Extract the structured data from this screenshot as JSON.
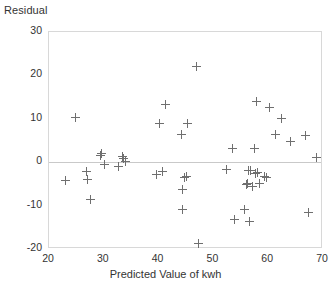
{
  "chart_data": {
    "type": "scatter",
    "title": "",
    "xlabel": "Predicted Value of kwh",
    "ylabel": "Residual",
    "xlim": [
      20,
      70
    ],
    "ylim": [
      -20,
      30
    ],
    "xticks": [
      20,
      30,
      40,
      50,
      60,
      70
    ],
    "yticks": [
      30,
      20,
      10,
      0,
      -10,
      -20
    ],
    "grid": false,
    "legend": null,
    "reference_lines": [
      {
        "axis": "y",
        "value": 0
      }
    ],
    "marker": "plus",
    "marker_color": "#6f6f6f",
    "points": [
      {
        "x": 23.0,
        "y": -4.3
      },
      {
        "x": 24.8,
        "y": 10.2
      },
      {
        "x": 26.9,
        "y": -2.1
      },
      {
        "x": 27.1,
        "y": -4.1
      },
      {
        "x": 27.5,
        "y": -8.7
      },
      {
        "x": 29.4,
        "y": 1.6
      },
      {
        "x": 29.6,
        "y": 1.9
      },
      {
        "x": 30.2,
        "y": -0.6
      },
      {
        "x": 32.6,
        "y": -0.9
      },
      {
        "x": 33.4,
        "y": 1.3
      },
      {
        "x": 33.6,
        "y": 0.8
      },
      {
        "x": 33.9,
        "y": 0.1
      },
      {
        "x": 39.7,
        "y": -2.8
      },
      {
        "x": 40.2,
        "y": 9.0
      },
      {
        "x": 40.7,
        "y": -2.2
      },
      {
        "x": 41.2,
        "y": 13.4
      },
      {
        "x": 44.2,
        "y": 6.3
      },
      {
        "x": 44.3,
        "y": -6.4
      },
      {
        "x": 44.4,
        "y": -10.8
      },
      {
        "x": 44.8,
        "y": -3.5
      },
      {
        "x": 45.1,
        "y": -3.4
      },
      {
        "x": 45.3,
        "y": 8.9
      },
      {
        "x": 46.9,
        "y": 22.1
      },
      {
        "x": 47.2,
        "y": -18.7
      },
      {
        "x": 52.3,
        "y": -1.7
      },
      {
        "x": 53.4,
        "y": 3.2
      },
      {
        "x": 53.8,
        "y": -13.2
      },
      {
        "x": 55.6,
        "y": -10.9
      },
      {
        "x": 56.1,
        "y": -5.1
      },
      {
        "x": 56.2,
        "y": -4.9
      },
      {
        "x": 56.4,
        "y": -2.0
      },
      {
        "x": 56.5,
        "y": -13.6
      },
      {
        "x": 56.8,
        "y": -1.8
      },
      {
        "x": 57.1,
        "y": -5.5
      },
      {
        "x": 57.5,
        "y": 3.2
      },
      {
        "x": 57.7,
        "y": -2.6
      },
      {
        "x": 57.9,
        "y": 14.0
      },
      {
        "x": 58.1,
        "y": -2.4
      },
      {
        "x": 58.4,
        "y": -4.9
      },
      {
        "x": 59.3,
        "y": -3.3
      },
      {
        "x": 59.6,
        "y": -3.5
      },
      {
        "x": 60.2,
        "y": 12.6
      },
      {
        "x": 61.4,
        "y": 6.3
      },
      {
        "x": 62.5,
        "y": 10.1
      },
      {
        "x": 64.0,
        "y": 4.7
      },
      {
        "x": 66.8,
        "y": 6.1
      },
      {
        "x": 67.3,
        "y": -11.5
      },
      {
        "x": 68.8,
        "y": 1.0
      }
    ]
  }
}
